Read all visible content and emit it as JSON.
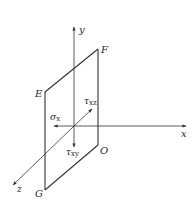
{
  "diagram": {
    "type": "stress-element-plane",
    "colors": {
      "line": "#333333",
      "text": "#2a2a2a",
      "background": "#ffffff"
    },
    "axes": {
      "x": {
        "label": "x"
      },
      "y": {
        "label": "y"
      },
      "z": {
        "label": "z"
      }
    },
    "plane_vertices": {
      "E": "E",
      "F": "F",
      "O": "O",
      "G": "G"
    },
    "stresses": {
      "sigma_x": {
        "symbol": "σ",
        "subscript": "x"
      },
      "tau_xy": {
        "symbol": "τ",
        "subscript": "xy"
      },
      "tau_xz": {
        "symbol": "τ",
        "subscript": "xz"
      }
    }
  }
}
